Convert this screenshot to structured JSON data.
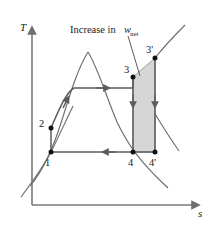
{
  "figure": {
    "background_color": "#ffffff",
    "width": 212,
    "height": 228
  },
  "axes": {
    "y_label": "T",
    "x_label": "s",
    "color": "#7a7a7a",
    "origin": [
      32,
      205
    ],
    "y_top": [
      32,
      26
    ],
    "x_right": [
      199,
      205
    ]
  },
  "annotation": {
    "text_prefix": "Increase in",
    "variable": "w",
    "subscript": "net",
    "full_text": "Increase in w_net",
    "leader_from": [
      128,
      38
    ],
    "leader_to": [
      140,
      74
    ]
  },
  "states": [
    {
      "id": "1",
      "label": "1",
      "x": 51,
      "y": 152,
      "label_x": 47,
      "label_y": 164
    },
    {
      "id": "2",
      "label": "2",
      "x": 51,
      "y": 128,
      "label_x": 41,
      "label_y": 126
    },
    {
      "id": "3",
      "label": "3",
      "x": 133,
      "y": 77,
      "label_x": 126,
      "label_y": 71
    },
    {
      "id": "3p",
      "label": "3'",
      "x": 155,
      "y": 58,
      "label_x": 148,
      "label_y": 51
    },
    {
      "id": "4",
      "label": "4",
      "x": 133,
      "y": 152,
      "label_x": 129,
      "label_y": 164
    },
    {
      "id": "4p",
      "label": "4'",
      "x": 155,
      "y": 152,
      "label_x": 151,
      "label_y": 164
    }
  ],
  "shaded_region": {
    "name": "increase-in-net-work-area",
    "fill_color": "#d6d6d6",
    "stroke_color": "#6e6e6e",
    "vertices": [
      [
        133,
        77
      ],
      [
        155,
        58
      ],
      [
        155,
        152
      ],
      [
        133,
        152
      ]
    ]
  },
  "curves": {
    "stroke_color": "#6e6e6e",
    "vapor_dome_peak": [
      88,
      52
    ],
    "saturated_liquid_line": "M 30,186 C 42,172 52,152 62,120 C 70,94 78,68 88,52",
    "saturated_vapor_line": "M 88,52 C 98,68 106,96 117,122 C 128,145 140,162 168,188",
    "isentropic_left_lower": "M 22,196 C 34,180 44,166 51,152",
    "isentropic_left_upper": "M 51,152 C 57,140 62,128 72,108",
    "isobar_right_upper": "M 155,58 C 163,48 172,38 184,26",
    "isobar_right_lower": "M 133,77 C 145,96 158,120 178,150"
  },
  "cycle_paths": [
    {
      "name": "pumping-1-to-2",
      "from": "1",
      "to": "2",
      "type": "vertical",
      "arrow": false
    },
    {
      "name": "heat-addition-2-to-3",
      "from": "2",
      "to": "3",
      "type": "curve",
      "arrow": true,
      "arrow_dir": "right"
    },
    {
      "name": "expansion-3-to-4",
      "from": "3",
      "to": "4",
      "type": "vertical",
      "arrow": true,
      "arrow_dir": "down"
    },
    {
      "name": "expansion-3p-to-4p",
      "from": "3p",
      "to": "4p",
      "type": "vertical",
      "arrow": true,
      "arrow_dir": "down"
    },
    {
      "name": "condensation-4-to-1",
      "from": "4",
      "to": "1",
      "type": "horizontal",
      "arrow": true,
      "arrow_dir": "left"
    }
  ],
  "colors": {
    "line": "#6e6e6e",
    "dark_line": "#4a4a4a",
    "point_fill": "#111111",
    "shade": "#d6d6d6",
    "text": "#1a1a1a"
  }
}
